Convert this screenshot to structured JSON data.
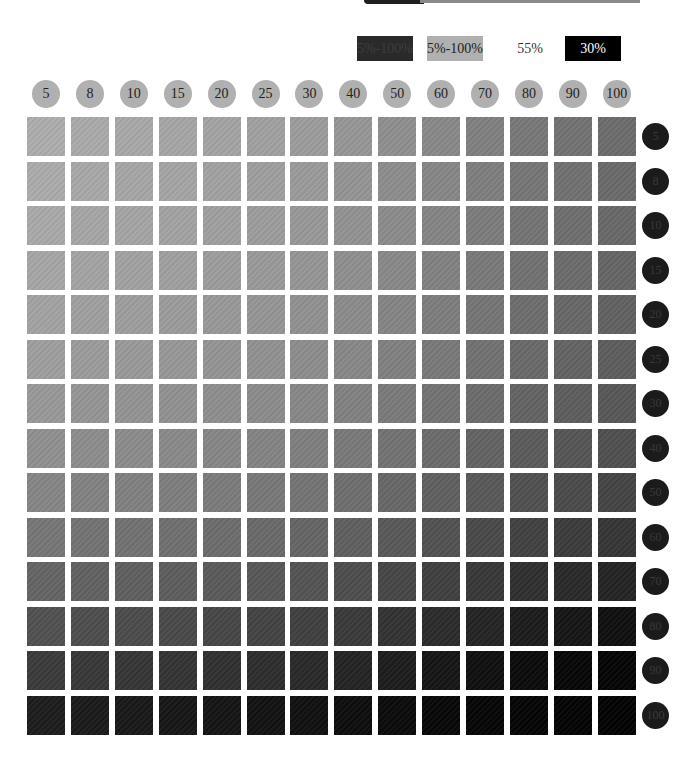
{
  "legend": [
    {
      "label": "5%-100%",
      "style": "dark",
      "bg": "#2a2a2a"
    },
    {
      "label": "5%-100%",
      "style": "light",
      "bg": "#b0b0b0"
    },
    {
      "label": "55%",
      "style": "plain",
      "bg": "#ffffff"
    },
    {
      "label": "30%",
      "style": "black",
      "bg": "#000000"
    }
  ],
  "columns": [
    "5",
    "8",
    "10",
    "15",
    "20",
    "25",
    "30",
    "40",
    "50",
    "60",
    "70",
    "80",
    "90",
    "100"
  ],
  "rows": [
    "5",
    "8",
    "10",
    "15",
    "20",
    "25",
    "30",
    "40",
    "50",
    "60",
    "70",
    "80",
    "90",
    "100"
  ],
  "chart_data": {
    "type": "heatmap",
    "title": "",
    "xlabel": "Column tint (%) — light gray header circles",
    "ylabel": "Row tint (%) — dark header circles",
    "x": [
      5,
      8,
      10,
      15,
      20,
      25,
      30,
      40,
      50,
      60,
      70,
      80,
      90,
      100
    ],
    "y": [
      5,
      8,
      10,
      15,
      20,
      25,
      30,
      40,
      50,
      60,
      70,
      80,
      90,
      100
    ],
    "legend": [
      "5%-100% (dark)",
      "5%-100% (light)",
      "55%",
      "30%"
    ],
    "color_scale": {
      "min_color": "#adadad",
      "max_color": "#050505"
    },
    "values_gray_level": [
      [
        173,
        170,
        168,
        166,
        163,
        160,
        156,
        150,
        143,
        136,
        128,
        120,
        114,
        108
      ],
      [
        171,
        168,
        166,
        164,
        161,
        158,
        154,
        148,
        141,
        134,
        126,
        118,
        112,
        106
      ],
      [
        169,
        166,
        164,
        162,
        159,
        156,
        152,
        146,
        139,
        132,
        124,
        116,
        110,
        104
      ],
      [
        166,
        163,
        161,
        159,
        156,
        153,
        149,
        143,
        136,
        129,
        121,
        113,
        107,
        101
      ],
      [
        162,
        159,
        157,
        155,
        152,
        149,
        145,
        139,
        132,
        125,
        117,
        109,
        103,
        97
      ],
      [
        158,
        155,
        153,
        151,
        148,
        145,
        141,
        135,
        128,
        121,
        113,
        105,
        99,
        93
      ],
      [
        152,
        149,
        147,
        145,
        142,
        139,
        135,
        129,
        122,
        115,
        107,
        99,
        93,
        87
      ],
      [
        144,
        141,
        139,
        137,
        134,
        131,
        127,
        121,
        114,
        107,
        99,
        91,
        85,
        79
      ],
      [
        133,
        130,
        128,
        126,
        123,
        120,
        116,
        110,
        103,
        96,
        88,
        80,
        74,
        68
      ],
      [
        118,
        115,
        113,
        111,
        108,
        105,
        101,
        95,
        88,
        81,
        73,
        65,
        59,
        53
      ],
      [
        100,
        97,
        95,
        93,
        90,
        87,
        83,
        77,
        70,
        63,
        55,
        47,
        41,
        35
      ],
      [
        80,
        77,
        75,
        73,
        70,
        67,
        63,
        57,
        50,
        43,
        35,
        27,
        21,
        15
      ],
      [
        58,
        55,
        53,
        51,
        48,
        45,
        41,
        35,
        28,
        21,
        15,
        10,
        6,
        4
      ],
      [
        28,
        26,
        24,
        22,
        20,
        18,
        16,
        13,
        10,
        7,
        5,
        4,
        3,
        2
      ]
    ],
    "grid": false
  }
}
